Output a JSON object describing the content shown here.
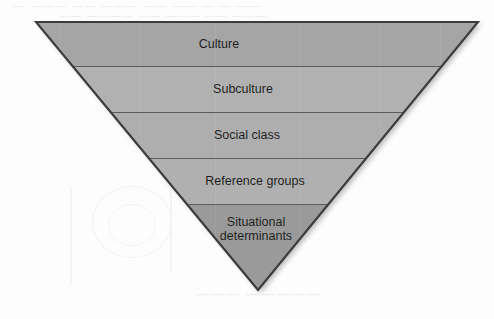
{
  "figure": {
    "shape": "inverted-triangle",
    "geometry": {
      "apex_left_x": 36,
      "apex_left_y": 22,
      "apex_right_x": 478,
      "apex_right_y": 22,
      "bottom_vertex_x": 258,
      "bottom_vertex_y": 290
    },
    "colors": {
      "band_dark": "#a5a5a5",
      "band_light": "#b1b1b1",
      "band_bottom": "#9a9a9a",
      "outline": "#3a3a3a",
      "divider": "#5a5a5a",
      "label_text": "#1b1b1b",
      "background": "#fdfdfd",
      "shadow": "#b9b9b9"
    },
    "bands": [
      {
        "label": "Culture",
        "y_top": 22,
        "y_bottom": 66,
        "fill": "#a5a5a5",
        "level": 1,
        "label_lines": 1
      },
      {
        "label": "Subculture",
        "y_top": 66,
        "y_bottom": 112,
        "fill": "#b1b1b1",
        "level": 2,
        "label_lines": 1
      },
      {
        "label": "Social class",
        "y_top": 112,
        "y_bottom": 158,
        "fill": "#aeaeae",
        "level": 3,
        "label_lines": 1
      },
      {
        "label": "Reference groups",
        "y_top": 158,
        "y_bottom": 204,
        "fill": "#b0b0b0",
        "level": 4,
        "label_lines": 1
      },
      {
        "label": "Situational\ndeterminants",
        "y_top": 204,
        "y_bottom": 290,
        "fill": "#9a9a9a",
        "level": 5,
        "label_lines": 2
      }
    ]
  },
  "artifacts": {
    "top_line_1": "—  ———  ——  ———  ——  ——  —  —  ——",
    "top_line_2": "——  ————  ——  ———  ——  ———",
    "bottom_text": "———   —————"
  }
}
